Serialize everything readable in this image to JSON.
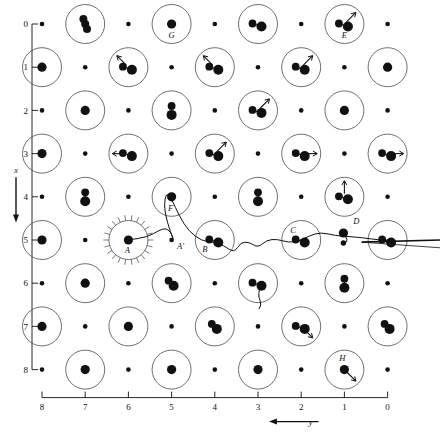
{
  "figure": {
    "type": "lattice-trajectory-diagram",
    "background": "#ffffff",
    "ink": "#111111",
    "circle_stroke": "#555555"
  },
  "axes": {
    "x": {
      "label": "y",
      "ticks": [
        "8",
        "7",
        "6",
        "5",
        "4",
        "3",
        "2",
        "1",
        "0"
      ],
      "values": [
        8,
        7,
        6,
        5,
        4,
        3,
        2,
        1,
        0
      ],
      "direction": "right-to-left",
      "arrow": "left",
      "position": "bottom"
    },
    "y": {
      "label": "x",
      "ticks": [
        "0",
        "1",
        "2",
        "3",
        "4",
        "5",
        "6",
        "7",
        "8"
      ],
      "values": [
        0,
        1,
        2,
        3,
        4,
        5,
        6,
        7,
        8
      ],
      "direction": "top-to-bottom",
      "arrow": "down",
      "position": "left"
    }
  },
  "chart_data": {
    "type": "scatter",
    "title": "",
    "xlabel": "y",
    "ylabel": "x",
    "xlim": [
      8,
      0
    ],
    "ylim": [
      0,
      8
    ],
    "grid": false,
    "legend": false,
    "lattice_note": "Checkerboard: sites where (row+col) is even are drawn as large open circles containing filled dots; the remaining sites are small bare dots.",
    "labelled_sites": [
      {
        "id": "A",
        "col": 6,
        "row": 5,
        "note": "starburst origin of trajectory"
      },
      {
        "id": "A'",
        "col": 5,
        "row": 5,
        "note": "small bare site on trajectory"
      },
      {
        "id": "B",
        "col": 4,
        "row": 5
      },
      {
        "id": "C",
        "col": 2,
        "row": 5
      },
      {
        "id": "D",
        "col": 1,
        "row": 4.75,
        "note": "bare site with pair near trajectory"
      },
      {
        "id": "E",
        "col": 1,
        "row": 0
      },
      {
        "id": "F",
        "col": 5,
        "row": 4
      },
      {
        "id": "G",
        "col": 5,
        "row": 0
      },
      {
        "id": "H",
        "col": 1,
        "row": 8
      }
    ],
    "sites": [
      {
        "col": 8,
        "row": 0,
        "circled": false,
        "dots": 1
      },
      {
        "col": 7,
        "row": 0,
        "circled": true,
        "dots": 3,
        "cluster": "vertical"
      },
      {
        "col": 6,
        "row": 0,
        "circled": false,
        "dots": 1
      },
      {
        "col": 5,
        "row": 0,
        "circled": true,
        "dots": 1,
        "label": "G"
      },
      {
        "col": 4,
        "row": 0,
        "circled": false,
        "dots": 1
      },
      {
        "col": 3,
        "row": 0,
        "circled": true,
        "dots": 2
      },
      {
        "col": 2,
        "row": 0,
        "circled": false,
        "dots": 1
      },
      {
        "col": 1,
        "row": 0,
        "circled": true,
        "dots": 2,
        "arrow": "ne",
        "label": "E"
      },
      {
        "col": 0,
        "row": 0,
        "circled": false,
        "dots": 1
      },
      {
        "col": 8,
        "row": 1,
        "circled": true,
        "dots": 1
      },
      {
        "col": 7,
        "row": 1,
        "circled": false,
        "dots": 1
      },
      {
        "col": 6,
        "row": 1,
        "circled": true,
        "dots": 2,
        "arrow": "nw"
      },
      {
        "col": 5,
        "row": 1,
        "circled": false,
        "dots": 1
      },
      {
        "col": 4,
        "row": 1,
        "circled": true,
        "dots": 2,
        "arrow": "nw"
      },
      {
        "col": 3,
        "row": 1,
        "circled": false,
        "dots": 1
      },
      {
        "col": 2,
        "row": 1,
        "circled": true,
        "dots": 2,
        "arrow": "ne"
      },
      {
        "col": 1,
        "row": 1,
        "circled": false,
        "dots": 1
      },
      {
        "col": 0,
        "row": 1,
        "circled": true,
        "dots": 1
      },
      {
        "col": 8,
        "row": 2,
        "circled": false,
        "dots": 1
      },
      {
        "col": 7,
        "row": 2,
        "circled": true,
        "dots": 1
      },
      {
        "col": 6,
        "row": 2,
        "circled": false,
        "dots": 1
      },
      {
        "col": 5,
        "row": 2,
        "circled": true,
        "dots": 2,
        "cluster": "vertical"
      },
      {
        "col": 4,
        "row": 2,
        "circled": false,
        "dots": 1
      },
      {
        "col": 3,
        "row": 2,
        "circled": true,
        "dots": 2,
        "arrow": "ne"
      },
      {
        "col": 2,
        "row": 2,
        "circled": false,
        "dots": 1
      },
      {
        "col": 1,
        "row": 2,
        "circled": true,
        "dots": 1
      },
      {
        "col": 0,
        "row": 2,
        "circled": false,
        "dots": 1
      },
      {
        "col": 8,
        "row": 3,
        "circled": true,
        "dots": 1
      },
      {
        "col": 7,
        "row": 3,
        "circled": false,
        "dots": 1
      },
      {
        "col": 6,
        "row": 3,
        "circled": true,
        "dots": 2,
        "arrow": "w"
      },
      {
        "col": 5,
        "row": 3,
        "circled": false,
        "dots": 1
      },
      {
        "col": 4,
        "row": 3,
        "circled": true,
        "dots": 2,
        "arrow": "ne"
      },
      {
        "col": 3,
        "row": 3,
        "circled": false,
        "dots": 1
      },
      {
        "col": 2,
        "row": 3,
        "circled": true,
        "dots": 2,
        "arrow": "e"
      },
      {
        "col": 1,
        "row": 3,
        "circled": false,
        "dots": 1
      },
      {
        "col": 0,
        "row": 3,
        "circled": true,
        "dots": 2,
        "arrow": "e"
      },
      {
        "col": 8,
        "row": 4,
        "circled": false,
        "dots": 1
      },
      {
        "col": 7,
        "row": 4,
        "circled": true,
        "dots": 2,
        "cluster": "vertical"
      },
      {
        "col": 6,
        "row": 4,
        "circled": false,
        "dots": 1
      },
      {
        "col": 5,
        "row": 4,
        "circled": true,
        "dots": 1,
        "label": "F"
      },
      {
        "col": 4,
        "row": 4,
        "circled": false,
        "dots": 1
      },
      {
        "col": 3,
        "row": 4,
        "circled": true,
        "dots": 2,
        "cluster": "vertical"
      },
      {
        "col": 2,
        "row": 4,
        "circled": false,
        "dots": 1
      },
      {
        "col": 1,
        "row": 4,
        "circled": true,
        "dots": 2,
        "arrow": "n"
      },
      {
        "col": 0,
        "row": 4,
        "circled": false,
        "dots": 1
      },
      {
        "col": 8,
        "row": 5,
        "circled": true,
        "dots": 1
      },
      {
        "col": 7,
        "row": 5,
        "circled": false,
        "dots": 1
      },
      {
        "col": 6,
        "row": 5,
        "circled": true,
        "dots": 1,
        "starburst": true,
        "label": "A"
      },
      {
        "col": 5,
        "row": 5,
        "circled": false,
        "dots": 1,
        "label": "A'"
      },
      {
        "col": 4,
        "row": 5,
        "circled": true,
        "dots": 2,
        "label": "B"
      },
      {
        "col": 3,
        "row": 5,
        "circled": false,
        "dots": 0
      },
      {
        "col": 2,
        "row": 5,
        "circled": true,
        "dots": 2,
        "label": "C"
      },
      {
        "col": 1,
        "row": 5,
        "circled": false,
        "dots": 2,
        "label": "D"
      },
      {
        "col": 0,
        "row": 5,
        "circled": true,
        "dots": 2
      },
      {
        "col": 8,
        "row": 6,
        "circled": false,
        "dots": 1
      },
      {
        "col": 7,
        "row": 6,
        "circled": true,
        "dots": 1
      },
      {
        "col": 6,
        "row": 6,
        "circled": false,
        "dots": 1
      },
      {
        "col": 5,
        "row": 6,
        "circled": true,
        "dots": 2,
        "cluster": "tight"
      },
      {
        "col": 4,
        "row": 6,
        "circled": false,
        "dots": 1
      },
      {
        "col": 3,
        "row": 6,
        "circled": true,
        "dots": 2,
        "tail": true
      },
      {
        "col": 2,
        "row": 6,
        "circled": false,
        "dots": 1
      },
      {
        "col": 1,
        "row": 6,
        "circled": true,
        "dots": 2,
        "cluster": "vertical"
      },
      {
        "col": 0,
        "row": 6,
        "circled": false,
        "dots": 1
      },
      {
        "col": 8,
        "row": 7,
        "circled": true,
        "dots": 1
      },
      {
        "col": 7,
        "row": 7,
        "circled": false,
        "dots": 1
      },
      {
        "col": 6,
        "row": 7,
        "circled": true,
        "dots": 1
      },
      {
        "col": 5,
        "row": 7,
        "circled": false,
        "dots": 1
      },
      {
        "col": 4,
        "row": 7,
        "circled": true,
        "dots": 2,
        "cluster": "tight"
      },
      {
        "col": 3,
        "row": 7,
        "circled": false,
        "dots": 1
      },
      {
        "col": 2,
        "row": 7,
        "circled": true,
        "dots": 2,
        "arrow": "se"
      },
      {
        "col": 1,
        "row": 7,
        "circled": false,
        "dots": 1
      },
      {
        "col": 0,
        "row": 7,
        "circled": true,
        "dots": 2,
        "cluster": "tight"
      },
      {
        "col": 8,
        "row": 8,
        "circled": false,
        "dots": 1
      },
      {
        "col": 7,
        "row": 8,
        "circled": true,
        "dots": 1
      },
      {
        "col": 6,
        "row": 8,
        "circled": false,
        "dots": 1
      },
      {
        "col": 5,
        "row": 8,
        "circled": true,
        "dots": 1
      },
      {
        "col": 4,
        "row": 8,
        "circled": false,
        "dots": 1
      },
      {
        "col": 3,
        "row": 8,
        "circled": true,
        "dots": 1
      },
      {
        "col": 2,
        "row": 8,
        "circled": false,
        "dots": 1
      },
      {
        "col": 1,
        "row": 8,
        "circled": true,
        "dots": 1,
        "arrow": "se",
        "label": "H"
      },
      {
        "col": 0,
        "row": 8,
        "circled": false,
        "dots": 1
      }
    ],
    "trajectory": {
      "description": "Particle path starting at site A (y=6,x=5), passing A', rising toward F, descending to B, continuing through C past D and exiting the right edge at x=5.",
      "waypoints": [
        {
          "y": 6.0,
          "x": 5.0
        },
        {
          "y": 5.55,
          "x": 4.93
        },
        {
          "y": 5.3,
          "x": 4.78
        },
        {
          "y": 5.12,
          "x": 4.72
        },
        {
          "y": 5.0,
          "x": 4.85
        },
        {
          "y": 4.95,
          "x": 5.02
        },
        {
          "y": 5.1,
          "x": 4.6
        },
        {
          "y": 5.18,
          "x": 4.2
        },
        {
          "y": 5.12,
          "x": 3.9
        },
        {
          "y": 5.0,
          "x": 4.05
        },
        {
          "y": 4.82,
          "x": 4.45
        },
        {
          "y": 4.6,
          "x": 4.8
        },
        {
          "y": 4.3,
          "x": 5.02
        },
        {
          "y": 4.05,
          "x": 5.05
        },
        {
          "y": 3.8,
          "x": 5.12
        },
        {
          "y": 3.55,
          "x": 5.3
        },
        {
          "y": 3.4,
          "x": 5.05
        },
        {
          "y": 3.2,
          "x": 5.05
        },
        {
          "y": 3.0,
          "x": 5.18
        },
        {
          "y": 2.8,
          "x": 5.0
        },
        {
          "y": 2.55,
          "x": 4.98
        },
        {
          "y": 2.3,
          "x": 5.06
        },
        {
          "y": 2.05,
          "x": 5.02
        },
        {
          "y": 1.8,
          "x": 4.9
        },
        {
          "y": 1.55,
          "x": 4.82
        },
        {
          "y": 1.2,
          "x": 4.9
        },
        {
          "y": 0.9,
          "x": 4.92
        },
        {
          "y": 0.55,
          "x": 4.95
        },
        {
          "y": 0.2,
          "x": 5.0
        },
        {
          "y": 0.0,
          "x": 5.0
        }
      ]
    }
  }
}
